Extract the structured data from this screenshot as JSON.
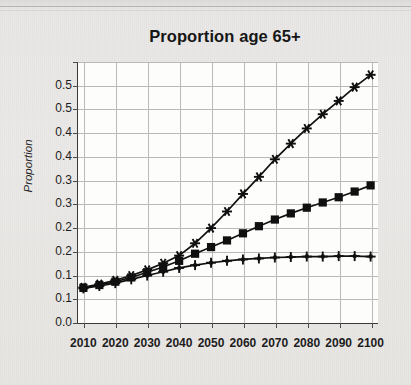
{
  "chart_data": {
    "type": "line",
    "title": "Proportion age 65+",
    "xlabel": "",
    "ylabel": "Proportion",
    "x": [
      2010,
      2015,
      2020,
      2025,
      2030,
      2035,
      2040,
      2045,
      2050,
      2055,
      2060,
      2065,
      2070,
      2075,
      2080,
      2085,
      2090,
      2095,
      2100
    ],
    "xlim": [
      2008,
      2102
    ],
    "ylim": [
      0.0,
      0.55
    ],
    "yticks": [
      0.0,
      0.05,
      0.1,
      0.15,
      0.2,
      0.25,
      0.3,
      0.35,
      0.4,
      0.45,
      0.5,
      0.55
    ],
    "ytick_labels": [
      "0.0",
      "0.1",
      "0.1",
      "0.2",
      "0.2",
      "0.3",
      "0.3",
      "0.4",
      "0.4",
      "0.5",
      "0.5"
    ],
    "xtick_labels": [
      "2010",
      "2020",
      "2030",
      "2040",
      "2050",
      "2060",
      "2070",
      "2080",
      "2090",
      "2100"
    ],
    "xticks": [
      2010,
      2020,
      2030,
      2040,
      2050,
      2060,
      2070,
      2080,
      2090,
      2100
    ],
    "grid": true,
    "legend": "none",
    "line_color": "#101010",
    "grid_color": "#b9b9b7",
    "plot_background": "#fdfdfc",
    "series": [
      {
        "name": "high-projection",
        "marker": "star",
        "values": [
          0.075,
          0.082,
          0.09,
          0.1,
          0.112,
          0.126,
          0.142,
          0.168,
          0.2,
          0.235,
          0.272,
          0.308,
          0.345,
          0.378,
          0.41,
          0.44,
          0.468,
          0.497,
          0.523
        ]
      },
      {
        "name": "mid-projection",
        "marker": "square",
        "values": [
          0.074,
          0.08,
          0.087,
          0.096,
          0.107,
          0.118,
          0.131,
          0.146,
          0.16,
          0.174,
          0.189,
          0.204,
          0.218,
          0.231,
          0.243,
          0.254,
          0.265,
          0.277,
          0.29
        ]
      },
      {
        "name": "low-projection",
        "marker": "plus",
        "values": [
          0.073,
          0.078,
          0.084,
          0.092,
          0.1,
          0.108,
          0.116,
          0.122,
          0.127,
          0.131,
          0.134,
          0.136,
          0.138,
          0.139,
          0.14,
          0.14,
          0.141,
          0.141,
          0.14
        ]
      }
    ]
  }
}
